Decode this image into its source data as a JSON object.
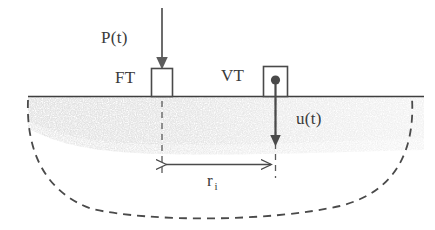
{
  "figure": {
    "background_color": "#ffffff",
    "ink_color": "#3a3a3a",
    "soil_color": "#b9b9b9",
    "labels": {
      "load": "P(t)",
      "force_transducer": "FT",
      "velocity_transducer": "VT",
      "displacement": "u(t)",
      "radius": "r",
      "radius_subscript": "i"
    },
    "elements": {
      "ground_surface_name": "ground-surface-line",
      "soil_band_name": "soil-stipple-band",
      "bulb_name": "dashed-influence-bulb",
      "load_arrow_name": "load-arrow",
      "displacement_arrow_name": "displacement-arrow",
      "ft_box_name": "force-transducer-box",
      "vt_box_name": "velocity-transducer-box",
      "dimension_name": "radius-dimension-line"
    }
  }
}
